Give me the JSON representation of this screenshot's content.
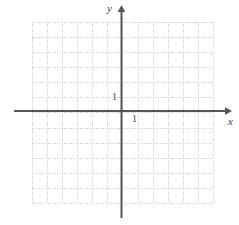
{
  "figure": {
    "kind": "cartesian-coordinate-grid",
    "width": 239,
    "height": 225,
    "background_color": "#ffffff"
  },
  "axes": {
    "x_axis": {
      "name": "x",
      "label": "x",
      "color": "#555555",
      "arrow": "right",
      "tick_label": "1"
    },
    "y_axis": {
      "name": "y",
      "label": "y",
      "color": "#555555",
      "arrow": "up",
      "tick_label": "1"
    }
  },
  "grid": {
    "style": "dotted",
    "color": "#bcbcbc",
    "columns": 12,
    "rows": 12,
    "cell_size_px": 15.08,
    "visible": true
  },
  "chart_data": {
    "type": "scatter",
    "title": "",
    "subtitle": "",
    "xlabel": "x",
    "ylabel": "y",
    "xlim": [
      -6,
      6
    ],
    "ylim": [
      -6,
      6
    ],
    "xticks": [
      1
    ],
    "yticks": [
      1
    ],
    "xticklabels": [
      "1"
    ],
    "yticklabels": [
      "1"
    ],
    "grid": true,
    "grid_style": "dotted",
    "legend": null,
    "series": [],
    "x": [],
    "values": [],
    "annotations": [
      {
        "text": "1",
        "x": 1,
        "y": 0,
        "placement": "below-right-of-origin"
      },
      {
        "text": "1",
        "x": 0,
        "y": 1,
        "placement": "left-of-y-axis"
      },
      {
        "text": "y",
        "placement": "top-of-y-axis"
      },
      {
        "text": "x",
        "placement": "right-of-x-axis"
      }
    ]
  }
}
